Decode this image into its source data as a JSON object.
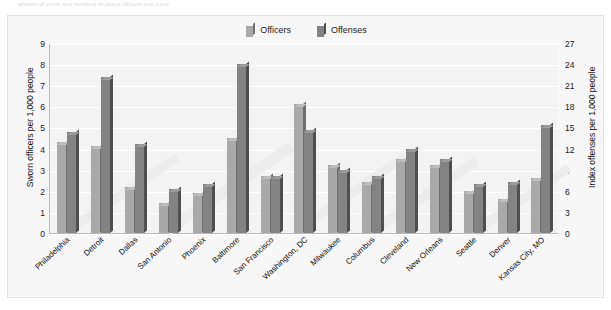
{
  "caption": "amount of crime and numbers of police officers and crime.",
  "legend": {
    "position": "top-center",
    "entries": [
      {
        "label": "Officers",
        "color": "#a9a9a9",
        "icon": "bar-swatch-icon"
      },
      {
        "label": "Offenses",
        "color": "#838383",
        "icon": "bar-swatch-icon"
      }
    ]
  },
  "chart_data": {
    "type": "bar",
    "title": "",
    "xlabel": "",
    "ylabel": "Sworn officers per 1,000 people",
    "y2label": "Index offenses per 1,000 people",
    "ylim": [
      0,
      9
    ],
    "y2lim": [
      0,
      27
    ],
    "yticks": [
      9,
      8,
      7,
      6,
      5,
      4,
      3,
      2,
      1,
      0
    ],
    "y2ticks": [
      27,
      24,
      21,
      18,
      15,
      12,
      9,
      6,
      3,
      0
    ],
    "grid": true,
    "legend_position": "top-center",
    "categories": [
      "Philadelphia",
      "Detroit",
      "Dallas",
      "San Antonio",
      "Phoenix",
      "Baltimore",
      "San Francisco",
      "Washington, DC",
      "Milwaukee",
      "Columbus",
      "Cleveland",
      "New Orleans",
      "Seattle",
      "Denver",
      "Kansas City, MO"
    ],
    "series": [
      {
        "name": "Officers",
        "axis": "left",
        "color": "#a9a9a9",
        "values": [
          4.3,
          4.1,
          2.2,
          1.4,
          1.9,
          4.5,
          2.7,
          6.1,
          3.2,
          2.4,
          3.5,
          3.2,
          2.0,
          1.6,
          2.6
        ]
      },
      {
        "name": "Offenses",
        "axis": "left",
        "color": "#838383",
        "values": [
          4.8,
          7.4,
          4.2,
          2.1,
          2.3,
          8.0,
          2.7,
          4.9,
          3.0,
          2.7,
          4.0,
          3.5,
          2.3,
          2.4,
          5.1
        ]
      }
    ]
  }
}
